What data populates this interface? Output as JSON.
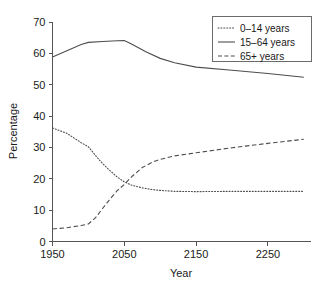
{
  "chart_data": {
    "type": "line",
    "title": "",
    "xlabel": "Year",
    "ylabel": "Percentage",
    "xlim": [
      1950,
      2310
    ],
    "ylim": [
      0,
      70
    ],
    "xticks": [
      1950,
      2050,
      2150,
      2250
    ],
    "xtick_labels": [
      "1950",
      "2050",
      "2150",
      "2250"
    ],
    "yticks": [
      0,
      10,
      20,
      30,
      40,
      50,
      60,
      70
    ],
    "ytick_labels": [
      "0",
      "10",
      "20",
      "30",
      "40",
      "50",
      "60",
      "70"
    ],
    "grid": false,
    "legend_position": "top-right",
    "series": [
      {
        "name": "0–14 years",
        "style": "dotted",
        "color": "#4d4d4d",
        "x": [
          1950,
          1970,
          1990,
          2000,
          2010,
          2020,
          2030,
          2040,
          2050,
          2060,
          2075,
          2090,
          2100,
          2120,
          2150,
          2200,
          2250,
          2300
        ],
        "values": [
          36.2,
          34.5,
          31.5,
          30.2,
          27.4,
          24.8,
          22.6,
          20.6,
          19.0,
          18.0,
          17.1,
          16.5,
          16.3,
          16.0,
          15.9,
          16.0,
          16.0,
          16.0
        ]
      },
      {
        "name": "15–64 years",
        "style": "solid",
        "color": "#4d4d4d",
        "x": [
          1950,
          1970,
          1990,
          2000,
          2020,
          2040,
          2050,
          2060,
          2080,
          2100,
          2120,
          2150,
          2200,
          2250,
          2300
        ],
        "values": [
          58.8,
          60.8,
          62.8,
          63.5,
          63.8,
          64.0,
          64.1,
          63.0,
          60.5,
          58.4,
          57.0,
          55.6,
          54.6,
          53.6,
          52.4
        ]
      },
      {
        "name": "65+ years",
        "style": "dashed",
        "color": "#4d4d4d",
        "x": [
          1950,
          1970,
          1990,
          2000,
          2010,
          2020,
          2030,
          2040,
          2050,
          2060,
          2075,
          2090,
          2100,
          2120,
          2150,
          2200,
          2250,
          2300
        ],
        "values": [
          4.0,
          4.4,
          5.1,
          5.6,
          7.6,
          10.6,
          13.5,
          16.2,
          18.2,
          20.6,
          23.6,
          25.4,
          26.2,
          27.3,
          28.3,
          29.9,
          31.3,
          32.6
        ]
      }
    ]
  },
  "legend": {
    "entries": [
      {
        "label": "0–14 years",
        "style": "dotted"
      },
      {
        "label": "15–64 years",
        "style": "solid"
      },
      {
        "label": "65+ years",
        "style": "dashed"
      }
    ]
  }
}
